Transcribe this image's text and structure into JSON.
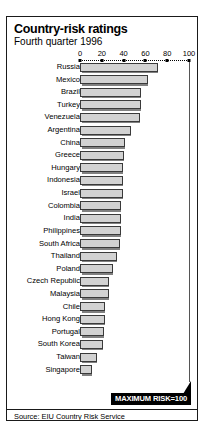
{
  "chart_data": {
    "type": "bar",
    "orientation": "horizontal",
    "title": "Country-risk ratings",
    "subtitle": "Fourth quarter 1996",
    "xlabel": "",
    "ylabel": "",
    "xlim": [
      0,
      100
    ],
    "xticks": [
      0,
      20,
      40,
      60,
      80,
      100
    ],
    "xtick_labels": [
      "0",
      "20",
      "40",
      "60",
      "80",
      "100"
    ],
    "grid": false,
    "legend": null,
    "annotation": "MAXIMUM RISK=100",
    "source": "Source: EIU Country Risk Service",
    "categories": [
      "Russia",
      "Mexico",
      "Brazil",
      "Turkey",
      "Venezuela",
      "Argentina",
      "China",
      "Greece",
      "Hungary",
      "Indonesia",
      "Israel",
      "Colombia",
      "India",
      "Philippines",
      "South Africa",
      "Thailand",
      "Poland",
      "Czech Republic",
      "Malaysia",
      "Chile",
      "Hong Kong",
      "Portugal",
      "South Korea",
      "Taiwan",
      "Singapore"
    ],
    "values": [
      72,
      62,
      56,
      56,
      55,
      47,
      41,
      40,
      39,
      39,
      39,
      38,
      38,
      38,
      37,
      34,
      30,
      27,
      27,
      23,
      23,
      22,
      21,
      16,
      11
    ]
  },
  "style": {
    "bar_fill": "#d2d2d2",
    "bar_stroke": "#3a3a3a",
    "frame_color": "#1a1a1a",
    "callout_bg": "#000000",
    "callout_fg": "#ffffff"
  }
}
